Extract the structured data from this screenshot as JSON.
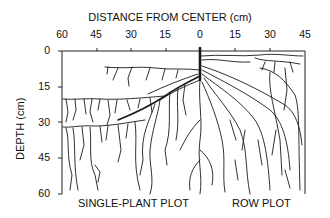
{
  "diagram": {
    "title": "DISTANCE FROM CENTER (cm)",
    "x_ticks": [
      "60",
      "45",
      "30",
      "15",
      "0",
      "15",
      "30",
      "45"
    ],
    "y_axis_label": "DEPTH (cm)",
    "y_ticks": [
      "0",
      "15",
      "30",
      "45",
      "60"
    ],
    "left_panel_label": "SINGLE-PLANT PLOT",
    "right_panel_label": "ROW PLOT",
    "line_color": "#1a1a1a",
    "background": "#ffffff"
  }
}
